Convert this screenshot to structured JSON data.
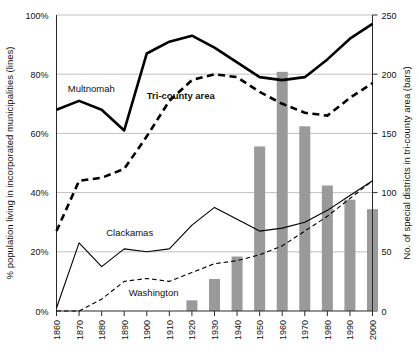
{
  "chart_data": {
    "type": "line",
    "title": "",
    "subtitle": "",
    "xlabel": "",
    "ylabel": "% population living in incorporated municipalities (lines)",
    "y2label": "No. of special districts in tri-county area (bars)",
    "grid": true,
    "legend": "inline-labels",
    "x": [
      1860,
      1870,
      1880,
      1890,
      1900,
      1910,
      1920,
      1930,
      1940,
      1950,
      1960,
      1970,
      1980,
      1990,
      2000
    ],
    "xtick_labels": [
      "1860",
      "1870",
      "1880",
      "1890",
      "1900",
      "1910",
      "1920",
      "1930",
      "1940",
      "1950",
      "1960",
      "1970",
      "1980",
      "1990",
      "2000"
    ],
    "ylim": [
      0,
      100
    ],
    "ytick_labels": [
      "0%",
      "20%",
      "40%",
      "60%",
      "80%",
      "100%"
    ],
    "ytick_values": [
      0,
      20,
      40,
      60,
      80,
      100
    ],
    "y2lim": [
      0,
      250
    ],
    "y2tick_labels": [
      "0",
      "50",
      "100",
      "150",
      "200",
      "250"
    ],
    "y2tick_values": [
      0,
      50,
      100,
      150,
      200,
      250
    ],
    "series": [
      {
        "name": "Multnomah",
        "style": "solid-thick",
        "axis": "left",
        "label_x": 1865,
        "label_y": 74,
        "values": [
          68,
          71,
          68,
          61,
          87,
          91,
          93,
          89,
          84,
          79,
          78,
          79,
          85,
          92,
          97
        ]
      },
      {
        "name": "Tri-county area",
        "style": "dashed-thick",
        "axis": "left",
        "label_x": 1900,
        "label_y": 71.5,
        "bold_label": true,
        "values": [
          27,
          44,
          45,
          48,
          59,
          71,
          78,
          80,
          79,
          74,
          70,
          67,
          66,
          72,
          77
        ]
      },
      {
        "name": "Clackamas",
        "style": "solid-thin",
        "axis": "left",
        "label_x": 1882,
        "label_y": 25.5,
        "values": [
          1,
          23,
          15,
          21,
          20,
          21,
          29,
          35,
          31,
          27,
          28,
          30,
          34,
          39,
          44
        ]
      },
      {
        "name": "Washington",
        "style": "dashed-thin",
        "axis": "left",
        "label_x": 1892,
        "label_y": 5,
        "values": [
          0,
          0,
          4,
          10,
          11,
          10,
          13,
          16,
          17,
          19,
          22,
          27,
          32,
          38,
          44
        ]
      }
    ],
    "bars": {
      "name": "No. of special districts in tri-county area",
      "axis": "right",
      "color": "#9a9a9a",
      "values": [
        0,
        0,
        0,
        0,
        0,
        0,
        9,
        27,
        46,
        139,
        202,
        156,
        106,
        94,
        86
      ]
    }
  }
}
